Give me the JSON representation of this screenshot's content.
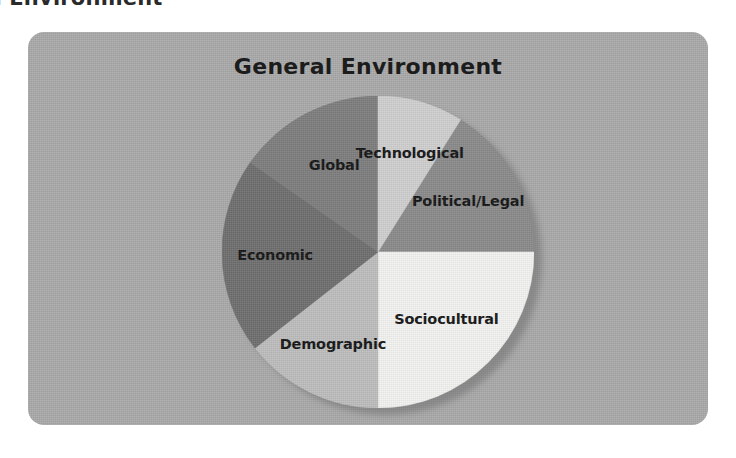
{
  "page": {
    "cut_off_heading": "General Environment",
    "background_color": "#ffffff"
  },
  "figure": {
    "title": "General Environment",
    "panel_color": "#a9a9a9",
    "title_color": "#1c1c1c"
  },
  "chart_data": {
    "type": "pie",
    "title": "General Environment",
    "xlabel": "",
    "ylabel": "",
    "legend_position": "none",
    "grid": false,
    "labels_inside_slices": true,
    "center": [
      377,
      250
    ],
    "radius": 155,
    "categories": [
      "Political/Legal",
      "Sociocultural",
      "Demographic",
      "Economic",
      "Global",
      "Technological"
    ],
    "values": [
      16.7,
      16.7,
      16.7,
      16.7,
      16.7,
      16.7
    ],
    "slices": [
      {
        "label": "Political/Legal",
        "value": 16.7,
        "color": "#8a8a8a",
        "start_angle": -58,
        "end_angle": 0,
        "label_angle": -29,
        "label_radius": 0.66
      },
      {
        "label": "Sociocultural",
        "value": 16.7,
        "color": "#f2f2f0",
        "start_angle": 0,
        "end_angle": 90,
        "label_angle": 45,
        "label_radius": 0.62
      },
      {
        "label": "Demographic",
        "value": 16.7,
        "color": "#bdbdbd",
        "start_angle": 90,
        "end_angle": 142,
        "label_angle": 116,
        "label_radius": 0.66
      },
      {
        "label": "Economic",
        "value": 16.7,
        "color": "#6e6e6e",
        "start_angle": 142,
        "end_angle": 215,
        "label_angle": 178,
        "label_radius": 0.66
      },
      {
        "label": "Global",
        "value": 16.7,
        "color": "#7d7d7d",
        "start_angle": 215,
        "end_angle": 270,
        "label_angle": 243,
        "label_radius": 0.62
      },
      {
        "label": "Technological",
        "value": 16.7,
        "color": "#cfcfcf",
        "start_angle": 270,
        "end_angle": 302,
        "label_angle": 288,
        "label_radius": 0.66
      }
    ]
  }
}
